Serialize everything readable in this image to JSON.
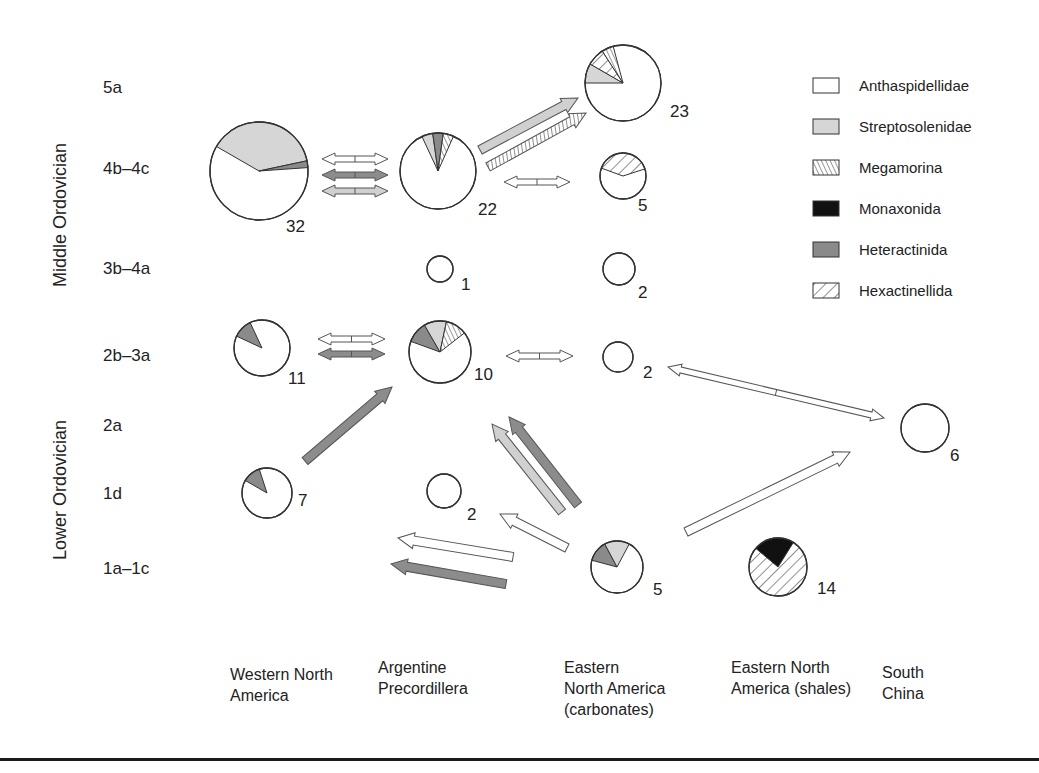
{
  "chart_data": {
    "type": "diagram",
    "title": "",
    "y_axis": {
      "period_labels": [
        {
          "label": "Middle Ordovician",
          "y_center": 215
        },
        {
          "label": "Lower Ordovician",
          "y_center": 490
        }
      ],
      "stages": [
        {
          "id": "5a",
          "label": "5a",
          "y": 87
        },
        {
          "id": "4b-4c",
          "label": "4b–4c",
          "y": 168
        },
        {
          "id": "3b-4a",
          "label": "3b–4a",
          "y": 268
        },
        {
          "id": "2b-3a",
          "label": "2b–3a",
          "y": 355
        },
        {
          "id": "2a",
          "label": "2a",
          "y": 425
        },
        {
          "id": "1d",
          "label": "1d",
          "y": 493
        },
        {
          "id": "1a-1c",
          "label": "1a–1c",
          "y": 568
        }
      ]
    },
    "regions": [
      {
        "id": "wna",
        "lines": [
          "Western North",
          " America"
        ],
        "x": 230
      },
      {
        "id": "ap",
        "lines": [
          "Argentine",
          "Precordillera"
        ],
        "x": 328
      },
      {
        "id": "enac",
        "lines": [
          "Eastern",
          "North America",
          "(carbonates)"
        ],
        "x": 446
      },
      {
        "id": "enas",
        "lines": [
          "Eastern North",
          "America (shales)"
        ],
        "x": 540
      },
      {
        "id": "sc",
        "lines": [
          "South",
          "China"
        ],
        "x": 665
      }
    ],
    "legend": [
      {
        "key": "anthaspidellidae",
        "label": "Anthaspidellidae",
        "fill": "#ffffff",
        "pattern": "none"
      },
      {
        "key": "streptosolenidae",
        "label": "Streptosolenidae",
        "fill": "#d8d8d8",
        "pattern": "none"
      },
      {
        "key": "megamorina",
        "label": "Megamorina",
        "fill": "#ffffff",
        "pattern": "back-hatch"
      },
      {
        "key": "monaxonida",
        "label": "Monaxonida",
        "fill": "#111111",
        "pattern": "none"
      },
      {
        "key": "heteractinida",
        "label": "Heteractinida",
        "fill": "#8a8a8a",
        "pattern": "none"
      },
      {
        "key": "hexactinellida",
        "label": "Hexactinellida",
        "fill": "#ffffff",
        "pattern": "forward-hatch"
      }
    ],
    "pies": [
      {
        "region": "Western North America",
        "stage": "4b–4c",
        "count": 32,
        "cx": 259,
        "cy": 171,
        "r": 49,
        "slices": [
          {
            "taxon": "streptosolenidae",
            "from": -150,
            "to": -12
          },
          {
            "taxon": "heteractinida",
            "from": -12,
            "to": -4
          }
        ]
      },
      {
        "region": "Argentine Precordillera",
        "stage": "4b–4c",
        "count": 22,
        "cx": 438,
        "cy": 171,
        "r": 38,
        "slices": [
          {
            "taxon": "streptosolenidae",
            "from": -115,
            "to": -98
          },
          {
            "taxon": "heteractinida",
            "from": -98,
            "to": -82
          },
          {
            "taxon": "megamorina",
            "from": -82,
            "to": -66
          }
        ]
      },
      {
        "region": "Eastern North America (carbonates)",
        "stage": "5a",
        "count": 23,
        "cx": 623,
        "cy": 83,
        "r": 38,
        "slices": [
          {
            "taxon": "streptosolenidae",
            "from": -180,
            "to": -150
          },
          {
            "taxon": "hexactinellida",
            "from": -150,
            "to": -123
          },
          {
            "taxon": "megamorina",
            "from": -123,
            "to": -105
          }
        ]
      },
      {
        "region": "Eastern North America (carbonates)",
        "stage": "4b–4c",
        "count": 5,
        "cx": 623,
        "cy": 176,
        "r": 23,
        "slices": [
          {
            "taxon": "hexactinellida",
            "from": -160,
            "to": -18
          }
        ]
      },
      {
        "region": "Argentine Precordillera",
        "stage": "3b–4a",
        "count": 1,
        "cx": 440,
        "cy": 269,
        "r": 13,
        "slices": []
      },
      {
        "region": "Eastern North America (carbonates)",
        "stage": "3b–4a",
        "count": 2,
        "cx": 619,
        "cy": 269,
        "r": 16,
        "slices": []
      },
      {
        "region": "Western North America",
        "stage": "2b–3a",
        "count": 11,
        "cx": 262,
        "cy": 348,
        "r": 28,
        "slices": [
          {
            "taxon": "heteractinida",
            "from": -155,
            "to": -115
          }
        ]
      },
      {
        "region": "Argentine Precordillera",
        "stage": "2b–3a",
        "count": 10,
        "cx": 440,
        "cy": 352,
        "r": 31,
        "slices": [
          {
            "taxon": "heteractinida",
            "from": -160,
            "to": -120
          },
          {
            "taxon": "streptosolenidae",
            "from": -120,
            "to": -78
          },
          {
            "taxon": "megamorina",
            "from": -78,
            "to": -38
          }
        ]
      },
      {
        "region": "Eastern North America (carbonates)",
        "stage": "2b–3a",
        "count": 2,
        "cx": 618,
        "cy": 357,
        "r": 15,
        "slices": []
      },
      {
        "region": "South China",
        "stage": "2a",
        "count": 6,
        "cx": 925,
        "cy": 428,
        "r": 24,
        "slices": []
      },
      {
        "region": "Western North America",
        "stage": "1d",
        "count": 7,
        "cx": 267,
        "cy": 493,
        "r": 25,
        "slices": [
          {
            "taxon": "heteractinida",
            "from": -150,
            "to": -108
          }
        ]
      },
      {
        "region": "Argentine Precordillera",
        "stage": "1d",
        "count": 2,
        "cx": 444,
        "cy": 491,
        "r": 17,
        "slices": []
      },
      {
        "region": "Eastern North America (carbonates)",
        "stage": "1a–1c",
        "count": 5,
        "cx": 617,
        "cy": 567,
        "r": 26,
        "slices": [
          {
            "taxon": "heteractinida",
            "from": -165,
            "to": -118
          },
          {
            "taxon": "streptosolenidae",
            "from": -118,
            "to": -62
          }
        ]
      },
      {
        "region": "Eastern North America (shales)",
        "stage": "1a–1c",
        "count": 14,
        "cx": 778,
        "cy": 567,
        "r": 29,
        "slices": [
          {
            "taxon": "monaxonida",
            "from": -140,
            "to": -58
          }
        ],
        "base": "hexactinellida"
      }
    ],
    "count_labels": [
      {
        "text": "32",
        "x": 286,
        "y": 232
      },
      {
        "text": "22",
        "x": 478,
        "y": 215
      },
      {
        "text": "23",
        "x": 670,
        "y": 117
      },
      {
        "text": "5",
        "x": 638,
        "y": 211
      },
      {
        "text": "1",
        "x": 461,
        "y": 290
      },
      {
        "text": "2",
        "x": 638,
        "y": 298
      },
      {
        "text": "11",
        "x": 288,
        "y": 384
      },
      {
        "text": "10",
        "x": 474,
        "y": 380
      },
      {
        "text": "2",
        "x": 643,
        "y": 378
      },
      {
        "text": "6",
        "x": 950,
        "y": 461
      },
      {
        "text": "7",
        "x": 298,
        "y": 506
      },
      {
        "text": "2",
        "x": 467,
        "y": 520
      },
      {
        "text": "5",
        "x": 653,
        "y": 595
      },
      {
        "text": "14",
        "x": 817,
        "y": 594
      }
    ],
    "arrows": [
      {
        "from": "WNA 4b–4c",
        "to": "AP 4b–4c",
        "taxon": "anthaspidellidae",
        "double": true,
        "x1": 322,
        "y1": 159,
        "x2": 388,
        "y2": 159
      },
      {
        "from": "WNA 4b–4c",
        "to": "AP 4b–4c",
        "taxon": "heteractinida",
        "double": true,
        "x1": 322,
        "y1": 175,
        "x2": 388,
        "y2": 175
      },
      {
        "from": "WNA 4b–4c",
        "to": "AP 4b–4c",
        "taxon": "streptosolenidae",
        "double": true,
        "x1": 322,
        "y1": 191,
        "x2": 388,
        "y2": 191
      },
      {
        "from": "AP 4b–4c",
        "to": "ENA(c) 5a",
        "taxon": "streptosolenidae",
        "double": false,
        "x1": 480,
        "y1": 150,
        "x2": 578,
        "y2": 98
      },
      {
        "from": "AP 4b–4c",
        "to": "ENA(c) 5a",
        "taxon": "megamorina",
        "double": false,
        "x1": 488,
        "y1": 167,
        "x2": 586,
        "y2": 113
      },
      {
        "from": "AP 4b–4c",
        "to": "ENA(c) 4b–4c",
        "taxon": "anthaspidellidae",
        "double": true,
        "x1": 504,
        "y1": 182,
        "x2": 570,
        "y2": 182
      },
      {
        "from": "WNA 2b–3a",
        "to": "AP 2b–3a",
        "taxon": "anthaspidellidae",
        "double": true,
        "x1": 318,
        "y1": 339,
        "x2": 385,
        "y2": 339
      },
      {
        "from": "WNA 2b–3a",
        "to": "AP 2b–3a",
        "taxon": "heteractinida",
        "double": true,
        "x1": 318,
        "y1": 354,
        "x2": 385,
        "y2": 354
      },
      {
        "from": "AP 2b–3a",
        "to": "ENA(c) 2b–3a",
        "taxon": "anthaspidellidae",
        "double": true,
        "x1": 506,
        "y1": 356,
        "x2": 573,
        "y2": 356
      },
      {
        "from": "ENA(c) 2b–3a",
        "to": "SC 2a",
        "taxon": "anthaspidellidae",
        "double": true,
        "x1": 668,
        "y1": 367,
        "x2": 884,
        "y2": 418
      },
      {
        "from": "WNA 1d",
        "to": "AP 2b–3a",
        "taxon": "heteractinida",
        "double": false,
        "x1": 305,
        "y1": 461,
        "x2": 392,
        "y2": 387
      },
      {
        "from": "ENA(c) 1a–1c",
        "to": "AP 2b–3a",
        "taxon": "streptosolenidae",
        "double": false,
        "x1": 562,
        "y1": 512,
        "x2": 492,
        "y2": 424
      },
      {
        "from": "ENA(c) 1a–1c",
        "to": "AP 2b–3a",
        "taxon": "heteractinida",
        "double": false,
        "x1": 578,
        "y1": 505,
        "x2": 509,
        "y2": 417
      },
      {
        "from": "ENA(c) 1a–1c",
        "to": "AP 1d",
        "taxon": "anthaspidellidae",
        "double": false,
        "x1": 567,
        "y1": 548,
        "x2": 500,
        "y2": 514
      },
      {
        "from": "ENA(c) 1a–1c",
        "to": "WNA 1a–1c",
        "taxon": "anthaspidellidae",
        "double": false,
        "x1": 513,
        "y1": 557,
        "x2": 398,
        "y2": 538
      },
      {
        "from": "ENA(c) 1a–1c",
        "to": "WNA 1a–1c",
        "taxon": "heteractinida",
        "double": false,
        "x1": 506,
        "y1": 584,
        "x2": 391,
        "y2": 564
      },
      {
        "from": "ENA(c) 1a–1c",
        "to": "SC 2a",
        "taxon": "anthaspidellidae",
        "double": false,
        "x1": 686,
        "y1": 532,
        "x2": 850,
        "y2": 452
      }
    ]
  }
}
